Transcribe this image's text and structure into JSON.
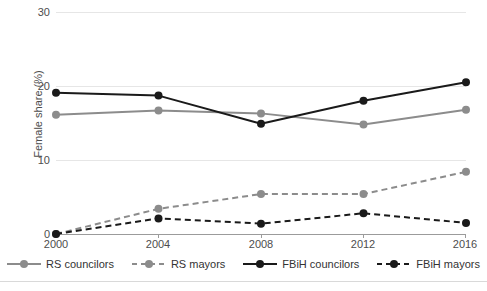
{
  "chart_data": {
    "type": "line",
    "title": "",
    "xlabel": "",
    "ylabel": "Female share (%)",
    "categories": [
      "2000",
      "2004",
      "2008",
      "2012",
      "2016"
    ],
    "x": [
      2000,
      2004,
      2008,
      2012,
      2016
    ],
    "xlim": [
      2000,
      2016
    ],
    "ylim": [
      0,
      30
    ],
    "yticks": [
      "0",
      "10",
      "20",
      "30"
    ],
    "ytick_values": [
      0,
      10,
      20,
      30
    ],
    "grid": "horizontal",
    "legend_position": "bottom",
    "series": [
      {
        "name": "RS councilors",
        "values": [
          16.1,
          16.7,
          16.3,
          14.8,
          16.8
        ],
        "color": "#8c8c8c",
        "dash": "solid",
        "marker": "circle"
      },
      {
        "name": "RS mayors",
        "values": [
          0.0,
          3.4,
          5.4,
          5.4,
          8.4
        ],
        "color": "#8c8c8c",
        "dash": "dashed",
        "marker": "circle"
      },
      {
        "name": "FBiH councilors",
        "values": [
          19.1,
          18.7,
          14.9,
          18.0,
          20.5
        ],
        "color": "#1a1a1a",
        "dash": "solid",
        "marker": "circle"
      },
      {
        "name": "FBiH mayors",
        "values": [
          0.0,
          2.1,
          1.4,
          2.8,
          1.5
        ],
        "color": "#1a1a1a",
        "dash": "dashed",
        "marker": "circle"
      }
    ]
  },
  "legend": {
    "items": [
      {
        "label": "RS councilors"
      },
      {
        "label": "RS mayors"
      },
      {
        "label": "FBiH councilors"
      },
      {
        "label": "FBiH mayors"
      }
    ]
  },
  "footer": {
    "caption": ""
  }
}
